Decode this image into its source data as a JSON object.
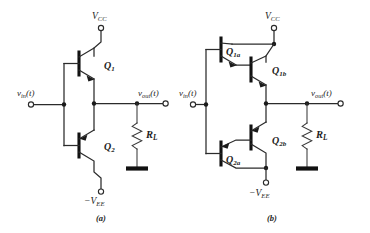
{
  "figure": {
    "background_color": "#ffffff",
    "ink_color": "#1a1a1a",
    "title_present": false
  },
  "panels": [
    {
      "id": "panel-a",
      "caption": "(a)",
      "description": "Complementary push-pull emitter-follower output stage with single NPN and single PNP transistor",
      "supply_top": {
        "symbol": "V",
        "subscript": "CC",
        "prefix": ""
      },
      "supply_bottom": {
        "symbol": "V",
        "subscript": "EE",
        "prefix": "−"
      },
      "input_label": {
        "symbol": "v",
        "subscript": "in",
        "arg": "(t)"
      },
      "output_label": {
        "symbol": "v",
        "subscript": "out",
        "arg": "(t)"
      },
      "load_label": {
        "symbol": "R",
        "subscript": "L"
      },
      "transistors": [
        {
          "name": "Q",
          "subscript": "1",
          "type": "npn",
          "position": "upper"
        },
        {
          "name": "Q",
          "subscript": "2",
          "type": "pnp",
          "position": "lower"
        }
      ]
    },
    {
      "id": "panel-b",
      "caption": "(b)",
      "description": "Darlington-pair complementary push-pull output stage",
      "supply_top": {
        "symbol": "V",
        "subscript": "CC",
        "prefix": ""
      },
      "supply_bottom": {
        "symbol": "V",
        "subscript": "EE",
        "prefix": "−"
      },
      "input_label": {
        "symbol": "v",
        "subscript": "in",
        "arg": "(t)"
      },
      "output_label": {
        "symbol": "v",
        "subscript": "out",
        "arg": "(t)"
      },
      "load_label": {
        "symbol": "R",
        "subscript": "L"
      },
      "transistors": [
        {
          "name": "Q",
          "subscript": "1a",
          "type": "npn",
          "position": "upper-driver"
        },
        {
          "name": "Q",
          "subscript": "1b",
          "type": "npn",
          "position": "upper-output"
        },
        {
          "name": "Q",
          "subscript": "2b",
          "type": "pnp",
          "position": "lower-output"
        },
        {
          "name": "Q",
          "subscript": "2a",
          "type": "pnp",
          "position": "lower-driver"
        }
      ]
    }
  ],
  "labels": {
    "a_vcc": "V",
    "a_vcc_sub": "CC",
    "a_vee_prefix": "−",
    "a_vee": "V",
    "a_vee_sub": "EE",
    "a_vin": "v",
    "a_vin_sub": "in",
    "a_vin_arg": "(t)",
    "a_vout": "v",
    "a_vout_sub": "out",
    "a_vout_arg": "(t)",
    "a_rl": "R",
    "a_rl_sub": "L",
    "a_q1": "Q",
    "a_q1_sub": "1",
    "a_q2": "Q",
    "a_q2_sub": "2",
    "a_caption": "(a)",
    "b_vcc": "V",
    "b_vcc_sub": "CC",
    "b_vee_prefix": "−",
    "b_vee": "V",
    "b_vee_sub": "EE",
    "b_vin": "v",
    "b_vin_sub": "in",
    "b_vin_arg": "(t)",
    "b_vout": "v",
    "b_vout_sub": "out",
    "b_vout_arg": "(t)",
    "b_rl": "R",
    "b_rl_sub": "L",
    "b_q1a": "Q",
    "b_q1a_sub": "1a",
    "b_q1b": "Q",
    "b_q1b_sub": "1b",
    "b_q2b": "Q",
    "b_q2b_sub": "2b",
    "b_q2a": "Q",
    "b_q2a_sub": "2a",
    "b_caption": "(b)"
  }
}
